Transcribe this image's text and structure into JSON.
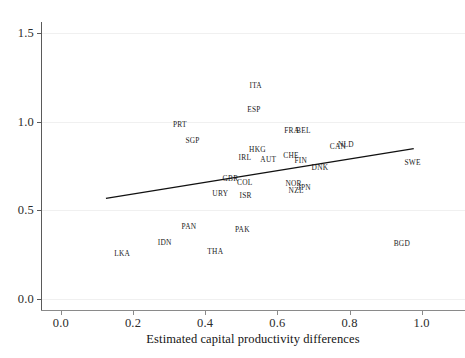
{
  "chart_data": {
    "type": "scatter",
    "title": "",
    "xlabel": "Estimated capital productivity differences",
    "ylabel": "",
    "xlim": [
      -0.055,
      1.12
    ],
    "ylim": [
      -0.06,
      1.56
    ],
    "xticks": [
      0.0,
      0.2,
      0.4,
      0.6,
      0.8,
      1.0
    ],
    "xtick_labels": [
      "0.0",
      "0.2",
      "0.4",
      "0.6",
      "0.8",
      "1.0"
    ],
    "yticks": [
      0.0,
      0.5,
      1.0,
      1.5
    ],
    "ytick_labels": [
      "0.0",
      "0.5",
      "1.0",
      "1.5"
    ],
    "grid": "horizontal-faint",
    "legend": "none",
    "marker_style": "text-label-only",
    "points": [
      {
        "label": "ITA",
        "x": 0.54,
        "y": 1.203
      },
      {
        "label": "ESP",
        "x": 0.535,
        "y": 1.072
      },
      {
        "label": "PRT",
        "x": 0.33,
        "y": 0.985
      },
      {
        "label": "FRA",
        "x": 0.64,
        "y": 0.95
      },
      {
        "label": "BEL",
        "x": 0.672,
        "y": 0.95
      },
      {
        "label": "SGP",
        "x": 0.365,
        "y": 0.898
      },
      {
        "label": "NLD",
        "x": 0.79,
        "y": 0.876
      },
      {
        "label": "CAN",
        "x": 0.768,
        "y": 0.862
      },
      {
        "label": "HKG",
        "x": 0.545,
        "y": 0.845
      },
      {
        "label": "CHE",
        "x": 0.638,
        "y": 0.813
      },
      {
        "label": "IRL",
        "x": 0.51,
        "y": 0.8
      },
      {
        "label": "AUT",
        "x": 0.575,
        "y": 0.788
      },
      {
        "label": "FIN",
        "x": 0.665,
        "y": 0.785
      },
      {
        "label": "SWE",
        "x": 0.975,
        "y": 0.772
      },
      {
        "label": "DNK",
        "x": 0.718,
        "y": 0.745
      },
      {
        "label": "GBR",
        "x": 0.47,
        "y": 0.683
      },
      {
        "label": "COL",
        "x": 0.51,
        "y": 0.658
      },
      {
        "label": "NOR",
        "x": 0.645,
        "y": 0.655
      },
      {
        "label": "JPN",
        "x": 0.675,
        "y": 0.633
      },
      {
        "label": "NZL",
        "x": 0.652,
        "y": 0.617
      },
      {
        "label": "URY",
        "x": 0.442,
        "y": 0.6
      },
      {
        "label": "ISR",
        "x": 0.512,
        "y": 0.588
      },
      {
        "label": "PAN",
        "x": 0.355,
        "y": 0.412
      },
      {
        "label": "PAK",
        "x": 0.503,
        "y": 0.395
      },
      {
        "label": "IDN",
        "x": 0.288,
        "y": 0.325
      },
      {
        "label": "BGD",
        "x": 0.945,
        "y": 0.318
      },
      {
        "label": "THA",
        "x": 0.428,
        "y": 0.272
      },
      {
        "label": "LKA",
        "x": 0.17,
        "y": 0.262
      }
    ],
    "fit_line": {
      "type": "linear",
      "x0": 0.125,
      "y0": 0.568,
      "x1": 0.978,
      "y1": 0.848
    }
  },
  "top_clipped_text": ""
}
